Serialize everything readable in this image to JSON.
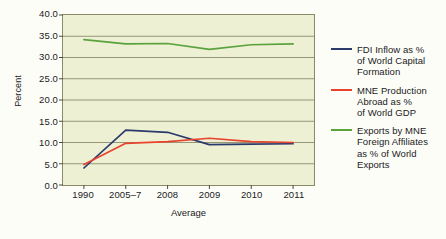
{
  "chart_data": {
    "type": "line",
    "title": "",
    "xlabel": "Average",
    "ylabel": "Percent",
    "categories": [
      "1990",
      "2005–7",
      "2008",
      "2009",
      "2010",
      "2011"
    ],
    "ylim": [
      0.0,
      40.0
    ],
    "yticks": [
      "40.0",
      "35.0",
      "30.0",
      "25.0",
      "20.0",
      "15.0",
      "10.0",
      "5.0",
      "0.0"
    ],
    "ytick_values": [
      40.0,
      35.0,
      30.0,
      25.0,
      20.0,
      15.0,
      10.0,
      5.0,
      0.0
    ],
    "grid": true,
    "legend_position": "right",
    "plot_background": "#eef0d4",
    "series": [
      {
        "name": "FDI Inflow as % of World Capital Formation",
        "color": "#2b3a6b",
        "values": [
          4.0,
          12.9,
          12.4,
          9.5,
          9.6,
          9.7
        ]
      },
      {
        "name": "MNE Production Abroad as % of World GDP",
        "color": "#e8432e",
        "values": [
          4.8,
          9.8,
          10.2,
          11.0,
          10.2,
          10.0
        ]
      },
      {
        "name": "Exports by MNE Foreign Affiliates as % of World Exports",
        "color": "#5aa23c",
        "values": [
          34.2,
          33.2,
          33.3,
          31.9,
          33.0,
          33.2
        ]
      }
    ]
  },
  "legend": {
    "entries": [
      {
        "color": "#2b3a6b",
        "lines": [
          "FDI Inflow as %",
          "of World Capital",
          "Formation"
        ]
      },
      {
        "color": "#e8432e",
        "lines": [
          "MNE Production",
          "Abroad as %",
          "of World GDP"
        ]
      },
      {
        "color": "#5aa23c",
        "lines": [
          "Exports by MNE",
          "Foreign Affiliates",
          "as % of World",
          "Exports"
        ]
      }
    ]
  }
}
